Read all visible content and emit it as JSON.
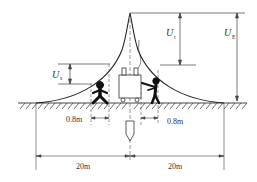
{
  "diagram": {
    "type": "ground-potential-distribution",
    "labels": {
      "touch_voltage": "U",
      "touch_voltage_sub": "t",
      "earth_potential": "U",
      "earth_potential_sub": "E",
      "step_voltage": "U",
      "step_voltage_sub": "s"
    },
    "dimensions": {
      "step_distance_left": "0.8m",
      "touch_distance_right": "0.8m",
      "radius_left": "20m",
      "radius_right": "20m"
    },
    "colors": {
      "line": "#333333",
      "figure": "#111111"
    }
  }
}
